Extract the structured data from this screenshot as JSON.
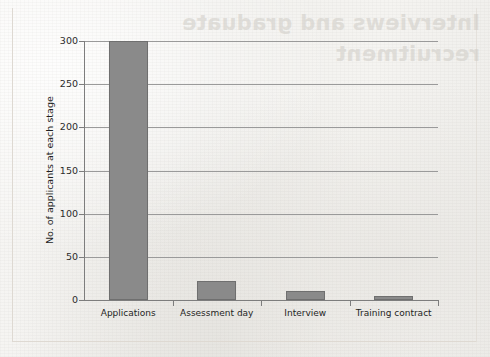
{
  "chart_data": {
    "type": "bar",
    "title": "",
    "subtitle": "",
    "xlabel": "",
    "ylabel": "No. of applicants at each stage",
    "categories": [
      "Applications",
      "Assessment day",
      "Interview",
      "Training contract"
    ],
    "values": [
      300,
      22,
      11,
      5
    ],
    "series": [
      {
        "name": "No. of applicants at each stage",
        "values": [
          300,
          22,
          11,
          5
        ]
      }
    ],
    "ylim": [
      0,
      300
    ],
    "ytick_labels": [
      "0",
      "50",
      "100",
      "150",
      "200",
      "250",
      "300"
    ],
    "ytick_values": [
      0,
      50,
      100,
      150,
      200,
      250,
      300
    ],
    "grid": "horizontal",
    "legend": "none",
    "bar_color": "#8a8a8a",
    "bar_border_color": "#6f6f6f",
    "gridline_color": "#9a9a9a",
    "axis_color": "#7d7d7d",
    "background_color": "#f4f3f1"
  },
  "page": {
    "bleed_through_text": "Interviews and graduate recruitment"
  }
}
